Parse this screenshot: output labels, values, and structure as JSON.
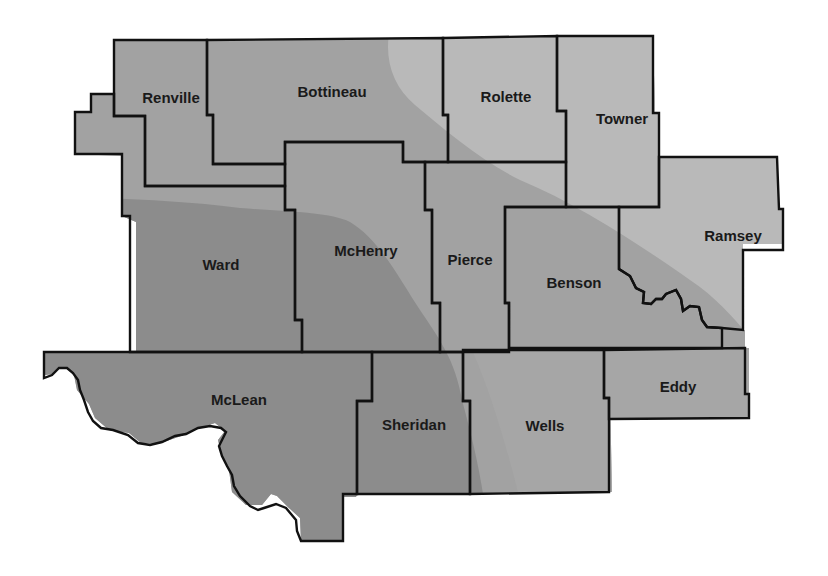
{
  "map": {
    "region": "North-central North Dakota counties",
    "shading_colors": {
      "dark": "#8c8c8c",
      "medium": "#a2a2a2",
      "light": "#b9b9b9"
    },
    "border_color": "#111111",
    "counties": [
      {
        "name": "Renville",
        "label_x": 171,
        "label_y": 103
      },
      {
        "name": "Bottineau",
        "label_x": 332,
        "label_y": 97
      },
      {
        "name": "Rolette",
        "label_x": 506,
        "label_y": 102
      },
      {
        "name": "Towner",
        "label_x": 622,
        "label_y": 124
      },
      {
        "name": "Ward",
        "label_x": 221,
        "label_y": 270
      },
      {
        "name": "McHenry",
        "label_x": 366,
        "label_y": 256
      },
      {
        "name": "Pierce",
        "label_x": 470,
        "label_y": 265
      },
      {
        "name": "Benson",
        "label_x": 574,
        "label_y": 288
      },
      {
        "name": "Ramsey",
        "label_x": 733,
        "label_y": 241
      },
      {
        "name": "McLean",
        "label_x": 239,
        "label_y": 405
      },
      {
        "name": "Sheridan",
        "label_x": 414,
        "label_y": 430
      },
      {
        "name": "Wells",
        "label_x": 545,
        "label_y": 431
      },
      {
        "name": "Eddy",
        "label_x": 678,
        "label_y": 392
      }
    ]
  }
}
